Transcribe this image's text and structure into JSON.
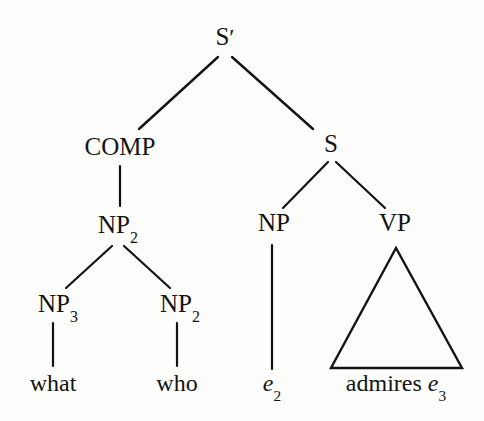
{
  "figure": {
    "kind": "syntax-tree",
    "background_color": "#fdfdfc",
    "ink_color": "#131313"
  },
  "nodes": [
    {
      "id": "sbar",
      "label": "S",
      "sup": "′",
      "sub": "",
      "italic": false,
      "x": 225,
      "y": 45,
      "kind": "category"
    },
    {
      "id": "comp",
      "label": "COMP",
      "sup": "",
      "sub": "",
      "italic": false,
      "x": 120,
      "y": 155,
      "kind": "category"
    },
    {
      "id": "s",
      "label": "S",
      "sup": "",
      "sub": "",
      "italic": false,
      "x": 331,
      "y": 152,
      "kind": "category"
    },
    {
      "id": "np2a",
      "label": "NP",
      "sup": "",
      "sub": "2",
      "italic": false,
      "x": 118,
      "y": 233,
      "kind": "category"
    },
    {
      "id": "np",
      "label": "NP",
      "sup": "",
      "sub": "",
      "italic": false,
      "x": 274,
      "y": 231,
      "kind": "category"
    },
    {
      "id": "vp",
      "label": "VP",
      "sup": "",
      "sub": "",
      "italic": false,
      "x": 395,
      "y": 231,
      "kind": "category"
    },
    {
      "id": "np3",
      "label": "NP",
      "sup": "",
      "sub": "3",
      "italic": false,
      "x": 58,
      "y": 312,
      "kind": "category"
    },
    {
      "id": "np2b",
      "label": "NP",
      "sup": "",
      "sub": "2",
      "italic": false,
      "x": 180,
      "y": 312,
      "kind": "category"
    },
    {
      "id": "what",
      "label": "what",
      "sup": "",
      "sub": "",
      "italic": false,
      "x": 53,
      "y": 391,
      "kind": "terminal"
    },
    {
      "id": "who",
      "label": "who",
      "sup": "",
      "sub": "",
      "italic": false,
      "x": 177,
      "y": 391,
      "kind": "terminal"
    },
    {
      "id": "e2",
      "label": "e",
      "sup": "",
      "sub": "2",
      "italic": true,
      "x": 272,
      "y": 391,
      "kind": "terminal"
    },
    {
      "id": "adm",
      "label": "admires ",
      "sup": "",
      "sub": "",
      "italic": false,
      "x": 396,
      "y": 391,
      "kind": "terminal",
      "tail": {
        "label": "e",
        "sub": "3",
        "italic": true
      }
    }
  ],
  "edges": [
    {
      "id": "sbar-comp",
      "from": "sbar",
      "to": "comp",
      "x1": 218,
      "y1": 57,
      "x2": 139,
      "y2": 129,
      "width": 2.4
    },
    {
      "id": "sbar-s",
      "from": "sbar",
      "to": "s",
      "x1": 232,
      "y1": 57,
      "x2": 313,
      "y2": 129,
      "width": 2.4
    },
    {
      "id": "comp-np2",
      "from": "comp",
      "to": "np2a",
      "x1": 120,
      "y1": 166,
      "x2": 120,
      "y2": 206,
      "width": 2.2
    },
    {
      "id": "s-np",
      "from": "s",
      "to": "np",
      "x1": 328,
      "y1": 162,
      "x2": 283,
      "y2": 208,
      "width": 2.2
    },
    {
      "id": "s-vp",
      "from": "s",
      "to": "vp",
      "x1": 336,
      "y1": 162,
      "x2": 385,
      "y2": 208,
      "width": 2.2
    },
    {
      "id": "np2-np3",
      "from": "np2a",
      "to": "np3",
      "x1": 112,
      "y1": 246,
      "x2": 66,
      "y2": 288,
      "width": 2.2
    },
    {
      "id": "np2-np2b",
      "from": "np2a",
      "to": "np2b",
      "x1": 124,
      "y1": 246,
      "x2": 170,
      "y2": 288,
      "width": 2.2
    },
    {
      "id": "np3-what",
      "from": "np3",
      "to": "what",
      "x1": 53,
      "y1": 323,
      "x2": 53,
      "y2": 366,
      "width": 2.2
    },
    {
      "id": "np2b-who",
      "from": "np2b",
      "to": "who",
      "x1": 177,
      "y1": 323,
      "x2": 177,
      "y2": 366,
      "width": 2.2
    },
    {
      "id": "np-e2",
      "from": "np",
      "to": "e2",
      "x1": 272,
      "y1": 245,
      "x2": 272,
      "y2": 369,
      "width": 2.2
    }
  ],
  "triangles": [
    {
      "id": "vp-triangle",
      "from": "vp",
      "to": "adm",
      "apex_x": 396,
      "apex_y": 248,
      "left_x": 331,
      "right_x": 462,
      "base_y": 368,
      "width": 2.4
    }
  ],
  "terminal_string": "what who e2 admires e3"
}
